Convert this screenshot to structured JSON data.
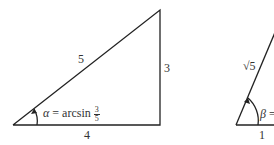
{
  "triangle_1": {
    "hypotenuse_label": "5",
    "opposite_label": "3",
    "adjacent_label": "4",
    "angle": {
      "symbol": "α",
      "equals": " = arcsin ",
      "fraction_numerator": "3",
      "fraction_denominator": "5"
    }
  },
  "triangle_2": {
    "hypotenuse_label": "√5",
    "adjacent_label": "1",
    "angle": {
      "symbol": "β",
      "equals": " ="
    }
  },
  "colors": {
    "line": "#222222",
    "text": "#333333"
  }
}
